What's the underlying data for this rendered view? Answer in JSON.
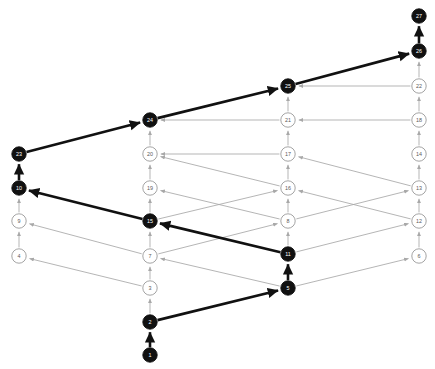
{
  "diagram": {
    "type": "directed-lattice-graph",
    "title": "",
    "width": 435,
    "height": 369,
    "background": "#ffffff",
    "colors": {
      "highlight_node_fill": "#111111",
      "highlight_node_text": "#ffffff",
      "normal_node_fill": "#ffffff",
      "normal_node_stroke": "#9a9a9a",
      "normal_node_text": "#5a5a5a",
      "thin_edge": "#a8a8a8",
      "bold_edge": "#111111"
    },
    "columns": [
      {
        "name": "column-1",
        "x": 19
      },
      {
        "name": "column-2",
        "x": 150
      },
      {
        "name": "column-3",
        "x": 288
      },
      {
        "name": "column-4",
        "x": 419
      }
    ],
    "nodes": [
      {
        "id": "1",
        "label": "1",
        "x": 150,
        "y": 355,
        "highlighted": true
      },
      {
        "id": "2",
        "label": "2",
        "x": 150,
        "y": 322,
        "highlighted": true
      },
      {
        "id": "3",
        "label": "3",
        "x": 150,
        "y": 288,
        "highlighted": false
      },
      {
        "id": "4",
        "label": "4",
        "x": 19,
        "y": 256,
        "highlighted": false
      },
      {
        "id": "5",
        "label": "5",
        "x": 288,
        "y": 288,
        "highlighted": true
      },
      {
        "id": "6",
        "label": "6",
        "x": 419,
        "y": 256,
        "highlighted": false
      },
      {
        "id": "7",
        "label": "7",
        "x": 150,
        "y": 256,
        "highlighted": false
      },
      {
        "id": "8",
        "label": "8",
        "x": 288,
        "y": 221,
        "highlighted": false
      },
      {
        "id": "9",
        "label": "9",
        "x": 19,
        "y": 221,
        "highlighted": false
      },
      {
        "id": "10",
        "label": "10",
        "x": 19,
        "y": 188,
        "highlighted": true
      },
      {
        "id": "11",
        "label": "11",
        "x": 288,
        "y": 254,
        "highlighted": true
      },
      {
        "id": "12",
        "label": "12",
        "x": 419,
        "y": 221,
        "highlighted": false
      },
      {
        "id": "13",
        "label": "13",
        "x": 419,
        "y": 188,
        "highlighted": false
      },
      {
        "id": "14",
        "label": "14",
        "x": 419,
        "y": 154,
        "highlighted": false
      },
      {
        "id": "15",
        "label": "15",
        "x": 150,
        "y": 221,
        "highlighted": true
      },
      {
        "id": "16",
        "label": "16",
        "x": 288,
        "y": 188,
        "highlighted": false
      },
      {
        "id": "17",
        "label": "17",
        "x": 288,
        "y": 154,
        "highlighted": false
      },
      {
        "id": "18",
        "label": "18",
        "x": 419,
        "y": 120,
        "highlighted": false
      },
      {
        "id": "19",
        "label": "19",
        "x": 150,
        "y": 188,
        "highlighted": false
      },
      {
        "id": "20",
        "label": "20",
        "x": 150,
        "y": 154,
        "highlighted": false
      },
      {
        "id": "21",
        "label": "21",
        "x": 288,
        "y": 120,
        "highlighted": false
      },
      {
        "id": "22",
        "label": "22",
        "x": 419,
        "y": 86,
        "highlighted": false
      },
      {
        "id": "23",
        "label": "23",
        "x": 19,
        "y": 154,
        "highlighted": true
      },
      {
        "id": "24",
        "label": "24",
        "x": 150,
        "y": 120,
        "highlighted": true
      },
      {
        "id": "25",
        "label": "25",
        "x": 288,
        "y": 86,
        "highlighted": true
      },
      {
        "id": "26",
        "label": "26",
        "x": 419,
        "y": 51,
        "highlighted": true
      },
      {
        "id": "27",
        "label": "27",
        "x": 419,
        "y": 16,
        "highlighted": true
      }
    ],
    "edges": [
      {
        "from": "1",
        "to": "2",
        "style": "bold"
      },
      {
        "from": "2",
        "to": "3",
        "style": "thin"
      },
      {
        "from": "2",
        "to": "5",
        "style": "bold"
      },
      {
        "from": "5",
        "to": "11",
        "style": "bold"
      },
      {
        "from": "5",
        "to": "7",
        "style": "thin"
      },
      {
        "from": "5",
        "to": "6",
        "style": "thin"
      },
      {
        "from": "3",
        "to": "7",
        "style": "thin"
      },
      {
        "from": "3",
        "to": "4",
        "style": "thin"
      },
      {
        "from": "7",
        "to": "15",
        "style": "thin"
      },
      {
        "from": "7",
        "to": "9",
        "style": "thin"
      },
      {
        "from": "7",
        "to": "8",
        "style": "thin"
      },
      {
        "from": "4",
        "to": "9",
        "style": "thin"
      },
      {
        "from": "11",
        "to": "15",
        "style": "bold"
      },
      {
        "from": "11",
        "to": "8",
        "style": "thin"
      },
      {
        "from": "11",
        "to": "12",
        "style": "thin"
      },
      {
        "from": "6",
        "to": "12",
        "style": "thin"
      },
      {
        "from": "15",
        "to": "10",
        "style": "bold"
      },
      {
        "from": "15",
        "to": "19",
        "style": "thin"
      },
      {
        "from": "15",
        "to": "16",
        "style": "thin"
      },
      {
        "from": "9",
        "to": "10",
        "style": "thin"
      },
      {
        "from": "8",
        "to": "16",
        "style": "thin"
      },
      {
        "from": "8",
        "to": "19",
        "style": "thin"
      },
      {
        "from": "8",
        "to": "13",
        "style": "thin"
      },
      {
        "from": "12",
        "to": "13",
        "style": "thin"
      },
      {
        "from": "12",
        "to": "16",
        "style": "thin"
      },
      {
        "from": "10",
        "to": "23",
        "style": "bold"
      },
      {
        "from": "19",
        "to": "20",
        "style": "thin"
      },
      {
        "from": "16",
        "to": "17",
        "style": "thin"
      },
      {
        "from": "16",
        "to": "20",
        "style": "thin"
      },
      {
        "from": "13",
        "to": "14",
        "style": "thin"
      },
      {
        "from": "13",
        "to": "17",
        "style": "thin"
      },
      {
        "from": "23",
        "to": "24",
        "style": "bold"
      },
      {
        "from": "20",
        "to": "24",
        "style": "thin"
      },
      {
        "from": "17",
        "to": "21",
        "style": "thin"
      },
      {
        "from": "17",
        "to": "20",
        "style": "thin"
      },
      {
        "from": "14",
        "to": "18",
        "style": "thin"
      },
      {
        "from": "24",
        "to": "25",
        "style": "bold"
      },
      {
        "from": "21",
        "to": "25",
        "style": "thin"
      },
      {
        "from": "21",
        "to": "24",
        "style": "thin"
      },
      {
        "from": "18",
        "to": "22",
        "style": "thin"
      },
      {
        "from": "18",
        "to": "21",
        "style": "thin"
      },
      {
        "from": "25",
        "to": "26",
        "style": "bold"
      },
      {
        "from": "22",
        "to": "26",
        "style": "thin"
      },
      {
        "from": "22",
        "to": "25",
        "style": "thin"
      },
      {
        "from": "26",
        "to": "27",
        "style": "bold"
      }
    ],
    "highlighted_path": [
      "1",
      "2",
      "5",
      "11",
      "15",
      "10",
      "23",
      "24",
      "25",
      "26",
      "27"
    ],
    "node_radius": 7.2
  }
}
